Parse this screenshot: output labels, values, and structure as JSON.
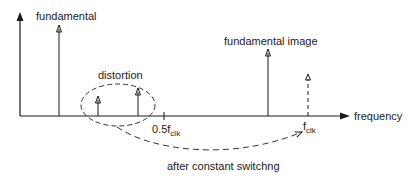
{
  "diagram": {
    "type": "frequency spectrum",
    "axis": {
      "x_label": "frequency",
      "ticks": [
        {
          "main": "0.5f",
          "sub": "clk"
        },
        {
          "main": "f",
          "sub": "clk"
        }
      ]
    },
    "labels": {
      "fundamental": "fundamental",
      "distortion": "distortion",
      "fundamental_image": "fundamental image",
      "after_switching": "after constant switchng"
    },
    "colors": {
      "line": "#1a1a1a",
      "background": "#ffffff"
    }
  }
}
